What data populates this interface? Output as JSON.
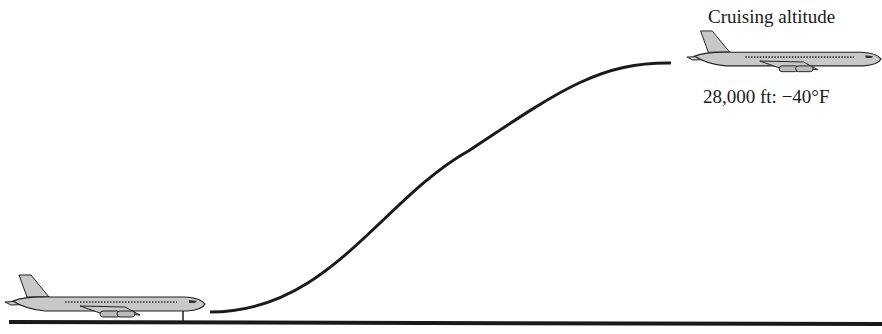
{
  "diagram": {
    "cruise_label": "Cruising altitude",
    "altitude_temp_label": "28,000 ft: −40°F",
    "elements": {
      "ground_plane": "airplane-on-runway",
      "cruise_plane": "airplane-at-cruise",
      "flight_path": "s-curve climb",
      "runway": "ground line"
    },
    "colors": {
      "line": "#1a1a1a",
      "plane_fill": "#c8c8c8"
    }
  }
}
